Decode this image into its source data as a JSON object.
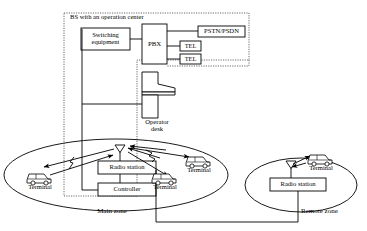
{
  "figure": {
    "type": "network-architecture-diagram",
    "title": "BS with an operation center"
  },
  "zones": {
    "bs_boundary_label": "BS with an operation center",
    "main_zone_label": "Main zone",
    "remote_zone_label": "Remote zone"
  },
  "boxes": {
    "switching_equipment": "Switching\nequipment",
    "switching_equipment_line1": "Switching",
    "switching_equipment_line2": "equipment",
    "pbx": "PBX",
    "pstn_psdn": "PSTN/PSDN",
    "tel_1": "TEL",
    "tel_2": "TEL",
    "operator_desk_line1": "Operator",
    "operator_desk_line2": "desk",
    "radio_station_main": "Radio station",
    "controller": "Controller",
    "radio_station_remote": "Radio station"
  },
  "terminals": {
    "main_left": "Terminal",
    "main_bottom": "Terminal",
    "main_right": "Terminal",
    "remote": "Terminal"
  },
  "icons": {
    "antenna_main": "antenna-icon",
    "antenna_remote": "antenna-icon",
    "vehicle": "vehicle-terminal-icon",
    "radio_wave": "radio-wave-icon"
  },
  "colors": {
    "stroke": "#000000",
    "background": "#ffffff",
    "box_fill": "#ffffff",
    "dashed_boundary": "#555555"
  }
}
